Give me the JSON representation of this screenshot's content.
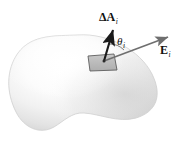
{
  "figure": {
    "background_color": "#ffffff",
    "labels": {
      "area_vector": {
        "symbol": "ΔA",
        "subscript": "i",
        "name": "delta-area-vector-label"
      },
      "field_vector": {
        "symbol": "E",
        "subscript": "i",
        "name": "electric-field-vector-label"
      },
      "angle": {
        "symbol": "θ",
        "subscript": "i",
        "name": "angle-theta-label"
      }
    },
    "surface": {
      "name": "closed-gaussian-surface",
      "shape": "irregular-blob",
      "fill_light": "#ffffff",
      "fill_mid": "#ededed",
      "fill_shadow": "#d2d2d2",
      "outline_color": "#c9c9c9"
    },
    "patch": {
      "name": "area-element-patch",
      "fill": "#b9b9b9",
      "stroke": "#555555",
      "description": "small parallelogram area element delta-A-i on the surface"
    },
    "vectors": [
      {
        "name": "area-normal-arrow",
        "label": "ΔA",
        "subscript": "i",
        "color": "#1a1a1a",
        "from": [
          104,
          61
        ],
        "to": [
          114,
          28
        ],
        "description": "outward normal vector of the area element"
      },
      {
        "name": "electric-field-arrow",
        "label": "E",
        "subscript": "i",
        "color": "#6b6b6b",
        "from": [
          104,
          61
        ],
        "to": [
          171,
          36
        ],
        "description": "electric field vector at the area element"
      }
    ],
    "angle_arc": {
      "name": "theta-angle-arc",
      "color": "#6b6b6b",
      "between": [
        "area-normal-arrow",
        "electric-field-arrow"
      ],
      "symbol": "θ",
      "subscript": "i"
    }
  }
}
